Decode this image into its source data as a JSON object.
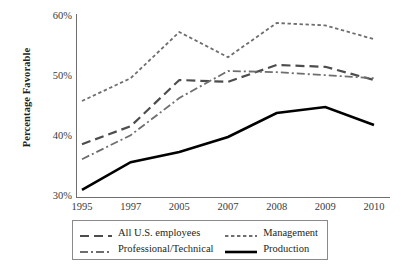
{
  "chart_data": {
    "type": "line",
    "title": "",
    "xlabel": "",
    "ylabel": "Percentage Favorable",
    "categories": [
      "1995",
      "1997",
      "2005",
      "2007",
      "2008",
      "2009",
      "2010"
    ],
    "ylim": [
      30,
      60
    ],
    "ytick_labels": [
      "30%",
      "40%",
      "50%",
      "60%"
    ],
    "ytick_values": [
      30,
      40,
      50,
      60
    ],
    "grid": false,
    "legend_position": "bottom",
    "series": [
      {
        "name": "All U.S. employees",
        "style": "dashed",
        "color": "#4d4d4d",
        "width": 2.2,
        "values": [
          38.8,
          41.8,
          49.5,
          49.2,
          52.0,
          51.7,
          49.5
        ]
      },
      {
        "name": "Management",
        "style": "dotted",
        "color": "#6e6e6e",
        "width": 1.8,
        "values": [
          46.0,
          49.8,
          57.5,
          53.3,
          59.0,
          58.6,
          56.3
        ]
      },
      {
        "name": "Professional/Technical",
        "style": "dashdot",
        "color": "#6e6e6e",
        "width": 1.8,
        "values": [
          36.3,
          40.3,
          46.5,
          51.0,
          50.8,
          50.3,
          49.8
        ]
      },
      {
        "name": "Production",
        "style": "solid",
        "color": "#000000",
        "width": 2.6,
        "values": [
          31.2,
          35.8,
          37.5,
          40.0,
          44.0,
          45.0,
          42.0
        ]
      }
    ]
  },
  "axis": {
    "yticks": [
      {
        "label": "60%",
        "value": 60
      },
      {
        "label": "50%",
        "value": 50
      },
      {
        "label": "40%",
        "value": 40
      },
      {
        "label": "30%",
        "value": 30
      }
    ],
    "xticks": [
      "1995",
      "1997",
      "2005",
      "2007",
      "2008",
      "2009",
      "2010"
    ],
    "y_title": "Percentage Favorable"
  },
  "legend": {
    "entries": [
      {
        "label": "All U.S. employees",
        "style": "dashed"
      },
      {
        "label": "Management",
        "style": "dotted"
      },
      {
        "label": "Professional/Technical",
        "style": "dashdot"
      },
      {
        "label": "Production",
        "style": "solid"
      }
    ]
  },
  "colors": {
    "axis": "#6e6e6e",
    "text": "#231f20",
    "tick_text": "#3a3a3a",
    "legend_border": "#8a8a8a",
    "background": "#ffffff"
  }
}
